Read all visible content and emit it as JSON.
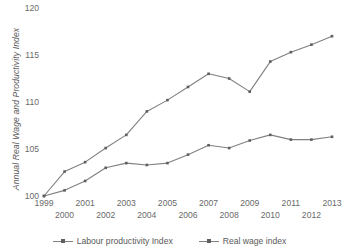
{
  "chart_data": {
    "type": "line",
    "title": "",
    "xlabel": "",
    "ylabel": "Annual Real Wage and Productivity Index",
    "ylim": [
      100,
      120
    ],
    "yticks": [
      100,
      105,
      110,
      115,
      120
    ],
    "grid": false,
    "legend_position": "bottom",
    "categories": [
      "1999",
      "2000",
      "2001",
      "2002",
      "2003",
      "2004",
      "2005",
      "2006",
      "2007",
      "2008",
      "2009",
      "2010",
      "2011",
      "2012",
      "2013"
    ],
    "series": [
      {
        "name": "Labour productivity Index",
        "color": "#808080",
        "marker": "square",
        "values": [
          100,
          102.6,
          103.6,
          105.1,
          106.5,
          109.0,
          110.2,
          111.6,
          113.0,
          112.5,
          111.1,
          114.3,
          115.3,
          116.1,
          117.0
        ]
      },
      {
        "name": "Real wage index",
        "color": "#808080",
        "marker": "square",
        "values": [
          100,
          100.6,
          101.6,
          103.0,
          103.5,
          103.3,
          103.5,
          104.4,
          105.4,
          105.1,
          105.9,
          106.5,
          106.0,
          106.0,
          106.3
        ]
      }
    ]
  },
  "axes": {
    "y_title": "Annual Real Wage and Productivity Index",
    "y_tick_labels": [
      "120",
      "115",
      "110",
      "105",
      "100"
    ],
    "x_tick_labels_row0": [
      "1999",
      "2001",
      "2003",
      "2005",
      "2007",
      "2009",
      "2011",
      "2013"
    ],
    "x_tick_labels_row1": [
      "2000",
      "2002",
      "2004",
      "2006",
      "2008",
      "2010",
      "2012"
    ]
  },
  "legend": {
    "items": [
      {
        "label": "Labour productivity Index"
      },
      {
        "label": "Real wage index"
      }
    ]
  },
  "colors": {
    "line": "#808080",
    "marker": "#5f5f5f",
    "text": "#5a5a5a",
    "tick_text": "#6a6a6a",
    "background": "#ffffff"
  }
}
